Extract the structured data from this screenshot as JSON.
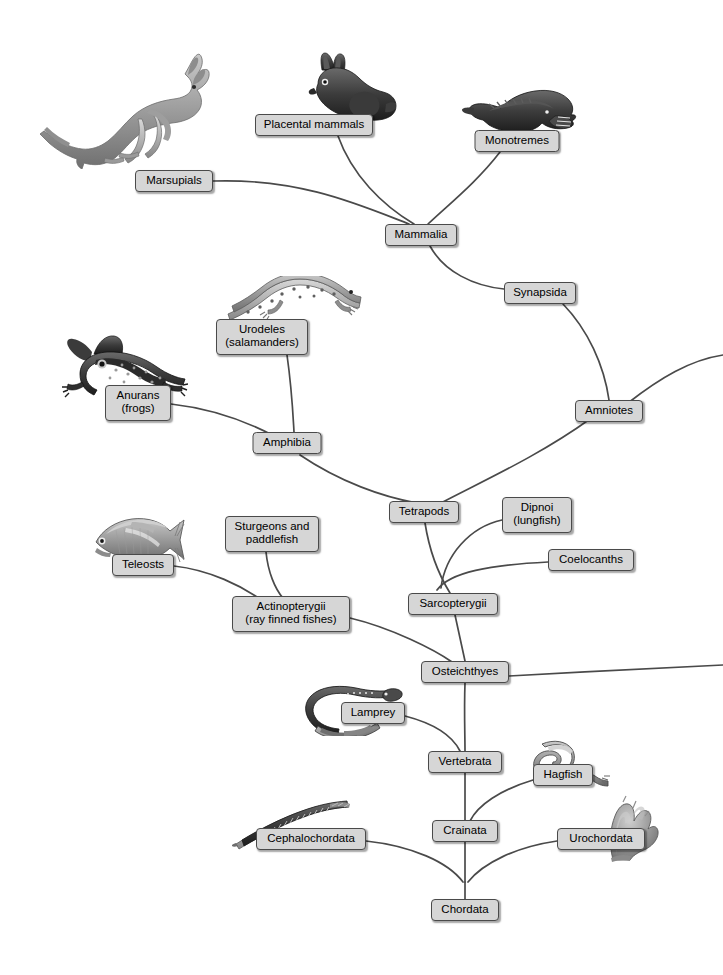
{
  "diagram": {
    "type": "cladogram",
    "width": 723,
    "height": 975,
    "background_color": "#ffffff",
    "branch_color": "#4a4a4a",
    "label_fill_color": "#d6d6d6",
    "label_border_color": "#4a4a4a",
    "label_text_color": "#000000"
  },
  "nodes": [
    {
      "id": "marsupials",
      "label": "Marsupials",
      "x": 174,
      "y": 181,
      "w": 78,
      "h": 22,
      "lines": 1
    },
    {
      "id": "placental",
      "label": "Placental mammals",
      "x": 314,
      "y": 125,
      "w": 118,
      "h": 22,
      "lines": 1
    },
    {
      "id": "monotremes",
      "label": "Monotremes",
      "x": 517,
      "y": 141,
      "w": 85,
      "h": 22,
      "lines": 1
    },
    {
      "id": "mammalia",
      "label": "Mammalia",
      "x": 421,
      "y": 235,
      "w": 72,
      "h": 22,
      "lines": 1
    },
    {
      "id": "synapsida",
      "label": "Synapsida",
      "x": 540,
      "y": 293,
      "w": 72,
      "h": 22,
      "lines": 1
    },
    {
      "id": "amniotes",
      "label": "Amniotes",
      "x": 609,
      "y": 411,
      "w": 68,
      "h": 22,
      "lines": 1
    },
    {
      "id": "urodeles",
      "label": "Urodeles\n(salamanders)",
      "x": 262,
      "y": 337,
      "w": 92,
      "h": 36,
      "lines": 2
    },
    {
      "id": "anurans",
      "label": "Anurans\n(frogs)",
      "x": 138,
      "y": 403,
      "w": 66,
      "h": 36,
      "lines": 2
    },
    {
      "id": "amphibia",
      "label": "Amphibia",
      "x": 287,
      "y": 443,
      "w": 69,
      "h": 22,
      "lines": 1
    },
    {
      "id": "tetrapods",
      "label": "Tetrapods",
      "x": 424,
      "y": 512,
      "w": 70,
      "h": 22,
      "lines": 1
    },
    {
      "id": "dipnoi",
      "label": "Dipnoi\n(lungfish)",
      "x": 537,
      "y": 515,
      "w": 70,
      "h": 36,
      "lines": 2
    },
    {
      "id": "coelocanths",
      "label": "Coelocanths",
      "x": 591,
      "y": 560,
      "w": 86,
      "h": 22,
      "lines": 1
    },
    {
      "id": "teleosts",
      "label": "Teleosts",
      "x": 143,
      "y": 565,
      "w": 62,
      "h": 22,
      "lines": 1
    },
    {
      "id": "sturgeons",
      "label": "Sturgeons and\npaddlefish",
      "x": 272,
      "y": 534,
      "w": 94,
      "h": 36,
      "lines": 2
    },
    {
      "id": "actinopterygii",
      "label": "Actinopterygii\n(ray finned fishes)",
      "x": 291,
      "y": 614,
      "w": 118,
      "h": 36,
      "lines": 2
    },
    {
      "id": "sarcopterygii",
      "label": "Sarcopterygii",
      "x": 453,
      "y": 604,
      "w": 90,
      "h": 22,
      "lines": 1
    },
    {
      "id": "osteichthyes",
      "label": "Osteichthyes",
      "x": 465,
      "y": 672,
      "w": 88,
      "h": 22,
      "lines": 1
    },
    {
      "id": "lamprey",
      "label": "Lamprey",
      "x": 373,
      "y": 713,
      "w": 64,
      "h": 22,
      "lines": 1
    },
    {
      "id": "vertebrata",
      "label": "Vertebrata",
      "x": 465,
      "y": 762,
      "w": 74,
      "h": 22,
      "lines": 1
    },
    {
      "id": "hagfish",
      "label": "Hagfish",
      "x": 563,
      "y": 775,
      "w": 60,
      "h": 22,
      "lines": 1
    },
    {
      "id": "crainata",
      "label": "Crainata",
      "x": 465,
      "y": 831,
      "w": 66,
      "h": 22,
      "lines": 1
    },
    {
      "id": "cephalochordata",
      "label": "Cephalochordata",
      "x": 311,
      "y": 839,
      "w": 110,
      "h": 22,
      "lines": 1
    },
    {
      "id": "urochordata",
      "label": "Urochordata",
      "x": 601,
      "y": 839,
      "w": 88,
      "h": 22,
      "lines": 1
    },
    {
      "id": "chordata",
      "label": "Chordata",
      "x": 465,
      "y": 910,
      "w": 68,
      "h": 22,
      "lines": 1
    }
  ],
  "branches": [
    {
      "id": "marsupials-to-mammalia",
      "from": "marsupials",
      "to": "mammalia",
      "path": "M 213 181 C 300 178 360 205 409 224"
    },
    {
      "id": "placental-to-mammalia",
      "from": "placental",
      "to": "mammalia",
      "path": "M 338 136 C 352 175 382 205 414 224"
    },
    {
      "id": "monotremes-to-mammalia",
      "from": "monotremes",
      "to": "mammalia",
      "path": "M 500 152 C 477 182 448 205 428 224"
    },
    {
      "id": "mammalia-to-synapsida",
      "from": "mammalia",
      "to": "synapsida",
      "path": "M 430 246 C 444 272 474 286 504 289"
    },
    {
      "id": "synapsida-to-amniotes",
      "from": "synapsida",
      "to": "amniotes",
      "path": "M 563 304 C 588 330 604 365 609 400"
    },
    {
      "id": "amniotes-to-right-edge",
      "from": "amniotes",
      "to": "offscreen-right",
      "path": "M 628 403 C 660 378 690 360 723 355"
    },
    {
      "id": "amniotes-to-tetrapods",
      "from": "amniotes",
      "to": "tetrapods",
      "path": "M 590 419 C 540 455 485 480 441 503"
    },
    {
      "id": "urodeles-to-amphibia",
      "from": "urodeles",
      "to": "amphibia",
      "path": "M 287 355 C 292 390 293 415 294 432"
    },
    {
      "id": "anurans-to-amphibia",
      "from": "anurans",
      "to": "amphibia",
      "path": "M 171 404 C 215 409 250 423 276 437"
    },
    {
      "id": "amphibia-to-tetrapods",
      "from": "amphibia",
      "to": "tetrapods",
      "path": "M 300 455 C 340 482 383 497 417 503"
    },
    {
      "id": "tetrapods-to-sarc-node",
      "from": "tetrapods",
      "to": "sarcopterygii",
      "path": "M 425 523 C 430 555 442 580 450 593"
    },
    {
      "id": "dipnoi-to-sarc-node",
      "from": "dipnoi",
      "to": "sarcopterygii",
      "path": "M 502 520 C 470 527 445 555 441 588"
    },
    {
      "id": "coelocanths-to-sarc-node",
      "from": "coelocanths",
      "to": "sarcopterygii",
      "path": "M 548 562 C 490 565 450 572 437 590"
    },
    {
      "id": "teleosts-to-actino",
      "from": "teleosts",
      "to": "actinopterygii",
      "path": "M 174 566 C 210 570 242 586 263 601"
    },
    {
      "id": "sturgeons-to-actino",
      "from": "sturgeons",
      "to": "actinopterygii",
      "path": "M 266 552 C 268 572 275 589 283 598"
    },
    {
      "id": "actino-to-osteichthyes",
      "from": "actinopterygii",
      "to": "osteichthyes",
      "path": "M 350 618 C 392 628 435 650 452 662"
    },
    {
      "id": "sarcopterygii-to-osteich",
      "from": "sarcopterygii",
      "to": "osteichthyes",
      "path": "M 455 615 C 460 638 463 652 465 661"
    },
    {
      "id": "osteichthyes-to-right-edge",
      "from": "osteichthyes",
      "to": "offscreen-right",
      "path": "M 509 676 C 580 672 660 668 723 665"
    },
    {
      "id": "osteichthyes-to-vertebrata",
      "from": "osteichthyes",
      "to": "vertebrata",
      "path": "M 465 683 C 464 710 465 735 465 751"
    },
    {
      "id": "lamprey-to-vertebrata",
      "from": "lamprey",
      "to": "vertebrata",
      "path": "M 405 716 C 432 723 452 735 460 751"
    },
    {
      "id": "vertebrata-to-crainata",
      "from": "vertebrata",
      "to": "crainata",
      "path": "M 465 773 C 465 795 465 812 465 820"
    },
    {
      "id": "hagfish-to-crainata",
      "from": "hagfish",
      "to": "crainata",
      "path": "M 533 780 C 500 790 478 805 470 821"
    },
    {
      "id": "crainata-to-chordata-node",
      "from": "crainata",
      "to": "chordata",
      "path": "M 465 842 C 465 862 465 875 465 882"
    },
    {
      "id": "cephalo-to-chordata-node",
      "from": "cephalochordata",
      "to": "chordata",
      "path": "M 366 841 C 412 846 448 862 463 882"
    },
    {
      "id": "urochordata-to-chordata-node",
      "from": "urochordata",
      "to": "chordata",
      "path": "M 557 841 C 516 847 483 863 468 882"
    },
    {
      "id": "chordata-stem",
      "from": "chordata-node",
      "to": "chordata",
      "path": "M 465 882 L 465 899"
    }
  ],
  "organisms": [
    {
      "id": "kangaroo",
      "name": "kangaroo-illustration",
      "represents": "Marsupials",
      "x": 38,
      "y": 47,
      "w": 176,
      "h": 122
    },
    {
      "id": "rabbit",
      "name": "rabbit-illustration",
      "represents": "Placental mammals",
      "x": 300,
      "y": 52,
      "w": 100,
      "h": 72
    },
    {
      "id": "platypus",
      "name": "platypus-illustration",
      "represents": "Monotremes",
      "x": 459,
      "y": 84,
      "w": 118,
      "h": 62
    },
    {
      "id": "salamander",
      "name": "salamander-illustration",
      "represents": "Urodeles",
      "x": 222,
      "y": 276,
      "w": 140,
      "h": 54
    },
    {
      "id": "frog",
      "name": "frog-illustration",
      "represents": "Anurans",
      "x": 60,
      "y": 332,
      "w": 128,
      "h": 72
    },
    {
      "id": "teleost-fish",
      "name": "teleost-fish-illustration",
      "represents": "Teleosts",
      "x": 86,
      "y": 514,
      "w": 106,
      "h": 56
    },
    {
      "id": "lamprey-animal",
      "name": "lamprey-illustration",
      "represents": "Lamprey",
      "x": 300,
      "y": 682,
      "w": 106,
      "h": 54
    },
    {
      "id": "hagfish-animal",
      "name": "hagfish-illustration",
      "represents": "Hagfish",
      "x": 512,
      "y": 736,
      "w": 100,
      "h": 52
    },
    {
      "id": "amphioxus",
      "name": "lancelet-illustration",
      "represents": "Cephalochordata",
      "x": 232,
      "y": 800,
      "w": 122,
      "h": 50
    },
    {
      "id": "tunicate",
      "name": "tunicate-illustration",
      "represents": "Urochordata",
      "x": 593,
      "y": 788,
      "w": 66,
      "h": 74
    }
  ]
}
